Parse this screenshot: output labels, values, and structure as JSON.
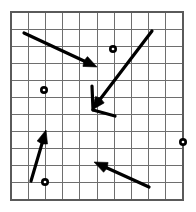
{
  "figure": {
    "width": 196,
    "height": 212,
    "background_color": "#ffffff"
  },
  "grid": {
    "x0": 11,
    "y0": 12,
    "x1": 183,
    "y1": 200,
    "columns": 10,
    "rows": 11,
    "cell_width": 17.2,
    "cell_height": 17.09,
    "line_color": "#6e6e6e",
    "border_color": "#5a5a5a",
    "show_grid": true
  },
  "chart_data": {
    "type": "scatter",
    "xlabel": "",
    "ylabel": "",
    "grid": true,
    "legend": "none",
    "xlim": [
      0,
      10
    ],
    "ylim": [
      0,
      11
    ],
    "vectors": [
      {
        "name": "vector-upper-left-to-center",
        "direction": "down-right",
        "tail": {
          "x": 24,
          "y": 33
        },
        "tip": {
          "x": 97,
          "y": 67
        },
        "color": "#000000",
        "has_arrowhead": true
      },
      {
        "name": "vector-upper-right-to-center",
        "direction": "down-left",
        "tail": {
          "x": 152,
          "y": 31
        },
        "tip": {
          "x": 92,
          "y": 110
        },
        "color": "#000000",
        "has_arrowhead": true
      },
      {
        "name": "vector-center-short-down",
        "direction": "down",
        "tail": {
          "x": 92,
          "y": 86
        },
        "tip": {
          "x": 93,
          "y": 110
        },
        "color": "#000000",
        "has_arrowhead": false
      },
      {
        "name": "vector-center-short-right",
        "direction": "right",
        "tail": {
          "x": 93,
          "y": 110
        },
        "tip": {
          "x": 115,
          "y": 116
        },
        "color": "#000000",
        "has_arrowhead": false
      },
      {
        "name": "vector-bottom-left-up",
        "direction": "up",
        "tail": {
          "x": 31,
          "y": 181
        },
        "tip": {
          "x": 46,
          "y": 130
        },
        "color": "#000000",
        "has_arrowhead": true
      },
      {
        "name": "vector-bottom-right-to-left",
        "direction": "up-left",
        "tail": {
          "x": 149,
          "y": 187
        },
        "tip": {
          "x": 94,
          "y": 162
        },
        "color": "#000000",
        "has_arrowhead": true
      }
    ],
    "points": [
      {
        "name": "point-top-center",
        "x": 113,
        "y": 49,
        "color": "#000000"
      },
      {
        "name": "point-mid-left",
        "x": 44,
        "y": 90,
        "color": "#000000"
      },
      {
        "name": "point-right-edge",
        "x": 183,
        "y": 142,
        "color": "#000000"
      },
      {
        "name": "point-bottom-left",
        "x": 45,
        "y": 182,
        "color": "#000000"
      }
    ]
  }
}
